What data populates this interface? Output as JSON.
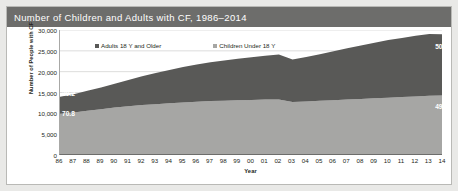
{
  "figure": {
    "title": "Number of Children and Adults with CF, 1986–2014"
  },
  "chart_data": {
    "type": "area",
    "stacked": true,
    "title": "Number of Children and Adults with CF, 1986–2014",
    "xlabel": "Year",
    "ylabel": "Number of People with CF",
    "ylim": [
      0,
      30000
    ],
    "yticks": [
      "0",
      "5,000",
      "10,000",
      "15,000",
      "20,000",
      "25,000",
      "30,000"
    ],
    "ytick_values": [
      0,
      5000,
      10000,
      15000,
      20000,
      25000,
      30000
    ],
    "grid": true,
    "legend_position": "top-inside",
    "categories": [
      "86",
      "87",
      "88",
      "89",
      "90",
      "91",
      "92",
      "93",
      "94",
      "95",
      "96",
      "97",
      "98",
      "99",
      "00",
      "01",
      "02",
      "03",
      "04",
      "05",
      "06",
      "07",
      "08",
      "09",
      "10",
      "11",
      "12",
      "13",
      "14"
    ],
    "series": [
      {
        "name": "Children Under 18 Y",
        "color": "#a6a6a4",
        "values": [
          9900,
          10200,
          10600,
          11000,
          11400,
          11700,
          12000,
          12200,
          12400,
          12600,
          12800,
          12950,
          13050,
          13150,
          13200,
          13300,
          13350,
          12700,
          12850,
          13000,
          13150,
          13300,
          13450,
          13600,
          13750,
          13900,
          14050,
          14200,
          14300
        ]
      },
      {
        "name": "Adults 18 Y and Older",
        "color": "#595957",
        "values": [
          4080,
          4400,
          4800,
          5200,
          5700,
          6300,
          6900,
          7500,
          8000,
          8500,
          8950,
          9300,
          9650,
          9950,
          10250,
          10500,
          10750,
          10200,
          10700,
          11200,
          11750,
          12300,
          12850,
          13350,
          13850,
          14200,
          14550,
          14850,
          14700
        ]
      }
    ],
    "annotations": [
      {
        "id": "adults-start",
        "text": "29.2",
        "series": "Adults 18 Y and Older",
        "year": "86",
        "unit": "percent"
      },
      {
        "id": "children-start",
        "text": "70.8",
        "series": "Children Under 18 Y",
        "year": "86",
        "unit": "percent"
      },
      {
        "id": "adults-end",
        "text": "50.7",
        "series": "Adults 18 Y and Older",
        "year": "14",
        "unit": "percent"
      },
      {
        "id": "children-end",
        "text": "49.3",
        "series": "Children Under 18 Y",
        "year": "14",
        "unit": "percent"
      }
    ]
  }
}
